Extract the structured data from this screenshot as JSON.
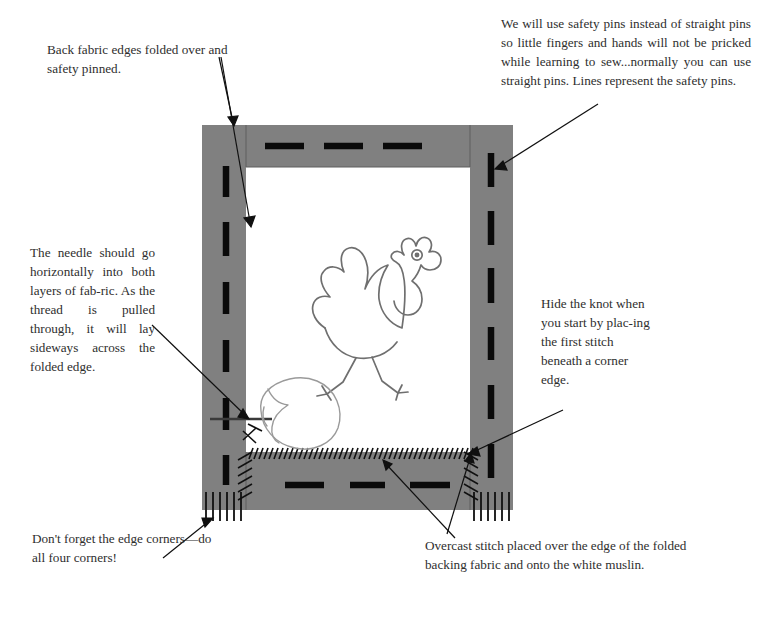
{
  "page": {
    "background_color": "#ffffff",
    "fabric_color": "#808080",
    "muslin_color": "#ffffff",
    "ink_color": "#000000",
    "text_color": "#2e2e2e",
    "drawing_color": "#6b6b6b"
  },
  "annotations": {
    "back_fabric": {
      "text": "Back fabric edges folded over and safety pinned.",
      "position": "top-left"
    },
    "safety_pins": {
      "text": "We will use safety pins instead of straight pins so little fingers and hands will not be pricked while learning to sew...normally you can use straight pins. Lines represent the safety pins.",
      "position": "top-right"
    },
    "needle": {
      "text": "The needle should go horizontally into both layers of fab-ric. As the thread is pulled through, it will lay sideways across the folded edge.",
      "position": "middle-left"
    },
    "hide_knot": {
      "text": "Hide the knot when you start by plac-ing the first stitch beneath a corner edge.",
      "position": "middle-right"
    },
    "corners": {
      "text": "Don't forget the edge corners—do all four corners!",
      "position": "bottom-left"
    },
    "overcast": {
      "text": "Overcast stitch placed over the edge of the folded backing fabric and onto the white muslin.",
      "position": "bottom-right"
    }
  },
  "figure": {
    "frame": {
      "outer": {
        "x": 202,
        "y": 125,
        "width": 311,
        "height": 385
      },
      "window": {
        "x": 246,
        "y": 167,
        "width": 224,
        "height": 285
      },
      "border_width": 44,
      "label": "gray backing fabric frame around white muslin"
    },
    "subject": {
      "name": "rooster-line-drawing",
      "description": "outline drawing of a rooster walking"
    },
    "egg": {
      "name": "egg-line-drawing",
      "description": "outline drawing of an egg at lower left of muslin"
    },
    "needle_thread": {
      "name": "needle-thread",
      "description": "horizontal needle line entering the folded edge with thread"
    },
    "pins": {
      "name": "safety-pin-marks",
      "description": "thick black dashes representing safety pins",
      "top_count": 3,
      "bottom_count": 3,
      "left_count": 5,
      "right_count": 5
    },
    "stitches": {
      "overcast": "diagonal hatch stitches over the inner folded edge",
      "corner": "vertical comb stitches along the outer bottom corners"
    }
  }
}
